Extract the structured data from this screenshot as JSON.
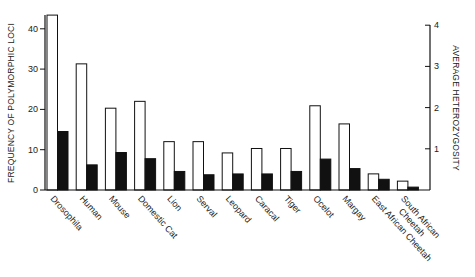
{
  "chart_data": {
    "type": "bar",
    "title": "",
    "xlabel": "",
    "ylabel": "FREQUENCY OF POLYMORPHIC LOCI",
    "y2label": "AVERAGE HETEROZYGOSITY",
    "ylim": [
      0,
      43
    ],
    "y2lim": [
      0,
      4.3
    ],
    "yticks": [
      "0",
      "10",
      "20",
      "30",
      "40"
    ],
    "y2ticks": [
      "1",
      "2",
      "3",
      "4"
    ],
    "categories": [
      "Drosophila",
      "Human",
      "Mouse",
      "Domestic Cat",
      "Lion",
      "Serval",
      "Leopard",
      "Caracal",
      "Tiger",
      "Ocelot",
      "Margay",
      "East African Cheetah",
      "South African Cheetah"
    ],
    "category_lines": [
      [
        "Drosophila"
      ],
      [
        "Human"
      ],
      [
        "Mouse"
      ],
      [
        "Domestic Cat"
      ],
      [
        "Lion"
      ],
      [
        "Serval"
      ],
      [
        "Leopard"
      ],
      [
        "Caracal"
      ],
      [
        "Tiger"
      ],
      [
        "Ocelot"
      ],
      [
        "Margay"
      ],
      [
        "East African Cheetah"
      ],
      [
        "South African",
        "Cheetah"
      ]
    ],
    "series": [
      {
        "name": "Frequency of polymorphic loci",
        "axis": "left",
        "color": "#ffffff",
        "stroke": "#111111",
        "values": [
          43.4,
          31.3,
          20.3,
          22.0,
          12.0,
          12.0,
          9.2,
          10.3,
          10.3,
          20.9,
          16.4,
          4.0,
          2.2
        ]
      },
      {
        "name": "Average heterozygosity",
        "axis": "right",
        "color": "#111111",
        "stroke": "#111111",
        "values": [
          1.42,
          0.61,
          0.91,
          0.76,
          0.45,
          0.37,
          0.39,
          0.39,
          0.45,
          0.75,
          0.52,
          0.26,
          0.07
        ]
      }
    ],
    "grid": false,
    "legend": "none"
  }
}
